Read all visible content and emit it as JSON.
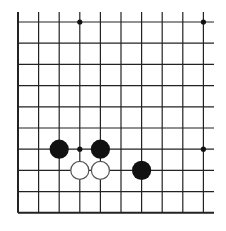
{
  "board": {
    "columns": 10,
    "rows": 10,
    "open_edges": [
      "top",
      "right"
    ],
    "edge_lines": [
      "left",
      "bottom"
    ],
    "colors": {
      "background": "#ffffff",
      "line": "#222222",
      "black_stone": "#111111",
      "white_stone_fill": "#ffffff",
      "white_stone_border": "#555555",
      "star_point": "#111111"
    },
    "star_points": [
      {
        "col": 3,
        "row": 0
      },
      {
        "col": 9,
        "row": 0
      },
      {
        "col": 3,
        "row": 6
      },
      {
        "col": 9,
        "row": 6
      }
    ],
    "stones": [
      {
        "color": "black",
        "col": 2,
        "row": 6
      },
      {
        "color": "black",
        "col": 4,
        "row": 6
      },
      {
        "color": "white",
        "col": 3,
        "row": 7
      },
      {
        "color": "white",
        "col": 4,
        "row": 7
      },
      {
        "color": "black",
        "col": 6,
        "row": 7
      }
    ]
  }
}
